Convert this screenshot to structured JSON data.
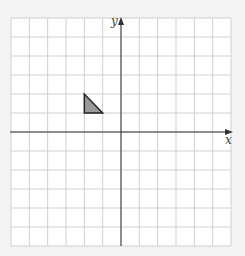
{
  "diagram": {
    "type": "coordinate-grid",
    "x_axis_label": "x",
    "y_axis_label": "y",
    "x_range": [
      -6,
      6
    ],
    "y_range": [
      -6,
      6
    ],
    "grid_step": 1,
    "colors": {
      "background": "#ffffff",
      "page": "#f4f4f4",
      "grid": "#cfcfcf",
      "axis": "#333333",
      "shape_fill": "#9a9a9a",
      "shape_stroke": "#222222"
    },
    "shapes": [
      {
        "name": "triangle",
        "vertices": [
          [
            -2,
            2
          ],
          [
            -2,
            1
          ],
          [
            -1,
            1
          ]
        ]
      }
    ]
  }
}
